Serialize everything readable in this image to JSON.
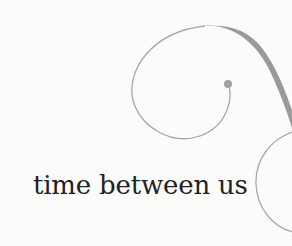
{
  "cover": {
    "title": "time between us",
    "colors": {
      "background": "#fbfbfa",
      "text": "#222222",
      "flourish": "#9a9a9a",
      "flourish_thin": "#aaaaaa"
    }
  }
}
